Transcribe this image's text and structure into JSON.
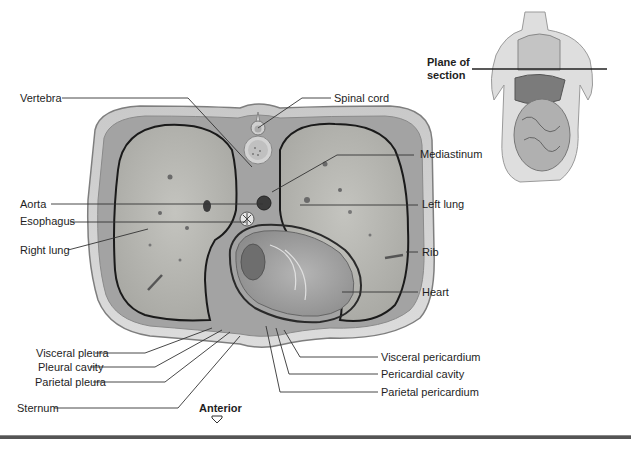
{
  "figure": {
    "type": "Transverse section of thorax",
    "labels_left": {
      "vertebra": "Vertebra",
      "aorta": "Aorta",
      "esophagus": "Esophagus",
      "right_lung": "Right lung",
      "visceral_pleura": "Visceral pleura",
      "pleural_cavity": "Pleural cavity",
      "parietal_pleura": "Parietal pleura",
      "sternum": "Sternum"
    },
    "labels_right": {
      "spinal_cord": "Spinal cord",
      "mediastinum": "Mediastinum",
      "left_lung": "Left lung",
      "rib": "Rib",
      "heart": "Heart",
      "visceral_pericardium": "Visceral pericardium",
      "pericardial_cavity": "Pericardial cavity",
      "parietal_pericardium": "Parietal pericardium"
    },
    "orientation": {
      "label": "Anterior",
      "icon": "arrow-down-outline-icon"
    },
    "inset": {
      "label_line1": "Plane of",
      "label_line2": "section"
    }
  },
  "colors": {
    "tissue_outer": "#cfcfcf",
    "tissue_edge": "#8a8a8a",
    "lung_fill": "#b8b8b4",
    "muscle": "#9a9a9a",
    "leader_line": "#333333",
    "footer_rule": "#555555"
  }
}
